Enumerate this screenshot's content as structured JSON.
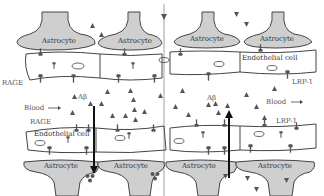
{
  "diagram": {
    "title": "",
    "colors": {
      "astrocyte_fill": "#cfcfcf",
      "outline": "#444444",
      "text": "#555555",
      "marker": "#555555",
      "arrow": "#111111",
      "background": "#ffffff"
    },
    "top_astrocytes": [
      {
        "label": "Astrocyte"
      },
      {
        "label": "Astrocyte"
      },
      {
        "label": "Astrocyte"
      },
      {
        "label": "Astrocyte"
      }
    ],
    "bottom_astrocytes": [
      {
        "label": "Astrocyte"
      },
      {
        "label": "Astrocyte"
      },
      {
        "label": "Astrocyte"
      },
      {
        "label": "Astrocyte"
      }
    ],
    "labels": {
      "rage_top": "RAGE",
      "rage_bottom": "RAGE",
      "lrp1_top": "LRP-1",
      "lrp1_bottom": "LRP-1",
      "endothelial_top": "Endothelial cell",
      "endothelial_bottom": "Endothelial cell",
      "abeta_left": "Aβ",
      "abeta_right": "Aβ",
      "blood_left": "Blood",
      "blood_right": "Blood",
      "arrow_glyph": "→"
    },
    "arrows": [
      {
        "name": "abeta-influx-arrow",
        "direction": "down",
        "via": "RAGE"
      },
      {
        "name": "abeta-efflux-arrow",
        "direction": "up",
        "via": "LRP-1"
      }
    ]
  }
}
